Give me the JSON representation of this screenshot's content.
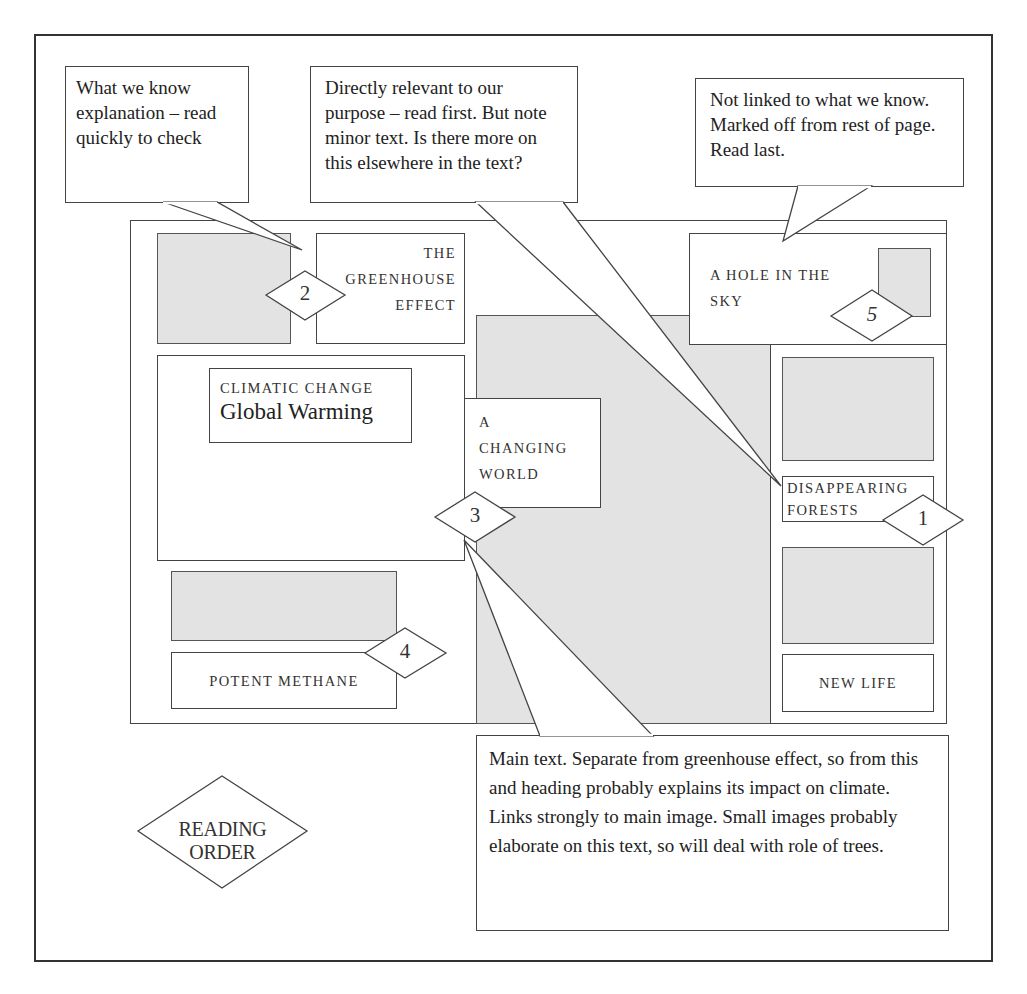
{
  "callouts": {
    "what_we_know": "What we know explanation – read quickly to check",
    "directly_relevant": "Directly relevant to our purpose – read first. But note minor text. Is there more on this elsewhere in the text?",
    "not_linked": "Not linked to what we know. Marked off from rest of page. Read last.",
    "main_text": "Main text. Separate from greenhouse effect, so from this and heading probably explains its impact on climate. Links strongly to main image. Small images probably elaborate on this text, so will deal with role of trees."
  },
  "page": {
    "greenhouse": {
      "line1": "THE",
      "line2": "GREENHOUSE",
      "line3": "EFFECT"
    },
    "hole_in_sky": {
      "line1": "A HOLE IN THE",
      "line2": "SKY"
    },
    "climatic_change": {
      "kicker": "CLIMATIC CHANGE",
      "title": "Global Warming"
    },
    "changing_world": {
      "line1": "A",
      "line2": "CHANGING",
      "line3": "WORLD"
    },
    "disappearing_forests": {
      "line1": "DISAPPEARING",
      "line2": "FORESTS"
    },
    "new_life": "NEW LIFE",
    "potent_methane": "POTENT METHANE"
  },
  "markers": [
    "1",
    "2",
    "3",
    "4",
    "5"
  ],
  "legend": {
    "label": "READING ORDER"
  }
}
